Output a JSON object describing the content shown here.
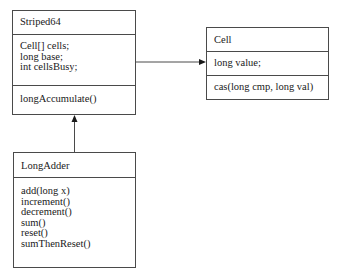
{
  "diagram": {
    "type": "uml-class-diagram",
    "classes": {
      "striped64": {
        "name": "Striped64",
        "attributes": [
          "Cell[] cells;",
          "long base;",
          "int cellsBusy;"
        ],
        "methods": [
          "longAccumulate()"
        ]
      },
      "cell": {
        "name": "Cell",
        "attributes": [
          "long value;"
        ],
        "methods": [
          "cas(long cmp, long val)"
        ]
      },
      "long_adder": {
        "name": "LongAdder",
        "attributes": [],
        "methods": [
          "add(long x)",
          "increment()",
          "decrement()",
          "sum()",
          "reset()",
          "sumThenReset()"
        ]
      }
    },
    "relationships": [
      {
        "from": "Striped64",
        "to": "Cell",
        "kind": "association-arrow"
      },
      {
        "from": "LongAdder",
        "to": "Striped64",
        "kind": "inheritance-arrow"
      }
    ],
    "colors": {
      "line": "#4a4a4a",
      "text": "#1a1a1a",
      "background": "#ffffff"
    }
  }
}
